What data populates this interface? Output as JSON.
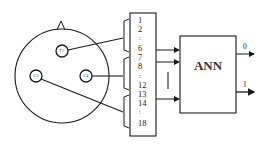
{
  "diagram": {
    "type": "EEG channels to ANN classifier",
    "head": {
      "electrodes": [
        {
          "label": "F7",
          "x": 62,
          "y": 51
        },
        {
          "label": "C3",
          "x": 36,
          "y": 76
        },
        {
          "label": "C4",
          "x": 86,
          "y": 76
        }
      ]
    },
    "channel_box": {
      "channels": [
        {
          "label": "1",
          "y": 20
        },
        {
          "label": "2",
          "y": 29
        },
        {
          "label": ":",
          "y": 38
        },
        {
          "label": "6",
          "y": 48
        },
        {
          "label": "7",
          "y": 57
        },
        {
          "label": "8",
          "y": 66
        },
        {
          "label": ":",
          "y": 76
        },
        {
          "label": "12",
          "y": 85
        },
        {
          "label": "13",
          "y": 94
        },
        {
          "label": "14",
          "y": 103
        },
        {
          "label": ":",
          "y": 112
        },
        {
          "label": "18",
          "y": 123
        }
      ],
      "groups": [
        {
          "electrode": "F7",
          "channels": "1-6"
        },
        {
          "electrode": "C4",
          "channels": "7-12"
        },
        {
          "electrode": "C3",
          "channels": "13-18"
        }
      ]
    },
    "ann": {
      "label": "ANN"
    },
    "outputs": [
      {
        "label": "0",
        "y": 54
      },
      {
        "label": "1",
        "y": 92
      }
    ],
    "colors": {
      "line": "#1a1a1a",
      "background": "#ffffff"
    }
  }
}
